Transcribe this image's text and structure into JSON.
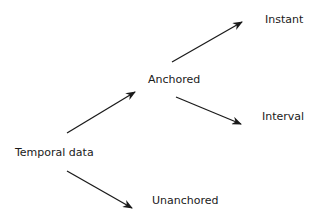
{
  "diagram": {
    "nodes": [
      {
        "id": "temporal",
        "label": "Temporal data"
      },
      {
        "id": "anchored",
        "label": "Anchored"
      },
      {
        "id": "unanchored",
        "label": "Unanchored"
      },
      {
        "id": "instant",
        "label": "Instant"
      },
      {
        "id": "interval",
        "label": "Interval"
      }
    ],
    "edges": [
      {
        "from": "temporal",
        "to": "anchored"
      },
      {
        "from": "temporal",
        "to": "unanchored"
      },
      {
        "from": "anchored",
        "to": "instant"
      },
      {
        "from": "anchored",
        "to": "interval"
      }
    ],
    "colors": {
      "arrow": "#1a1a1a",
      "text": "#1a1a1a"
    }
  }
}
